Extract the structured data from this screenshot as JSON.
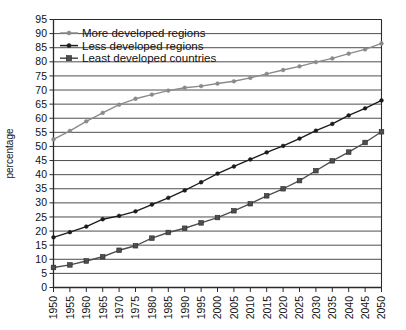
{
  "chart_data": {
    "type": "line",
    "title": "",
    "xlabel": "",
    "ylabel": "percentage",
    "ylim": [
      0,
      95
    ],
    "ytick_step": 5,
    "grid": true,
    "legend_position": "top-left",
    "x": [
      1950,
      1955,
      1960,
      1965,
      1970,
      1975,
      1980,
      1985,
      1990,
      1995,
      2000,
      2005,
      2010,
      2015,
      2020,
      2025,
      2030,
      2035,
      2040,
      2045,
      2050
    ],
    "xticks": [
      "1950",
      "1955",
      "1960",
      "1965",
      "1970",
      "1975",
      "1980",
      "1985",
      "1990",
      "1995",
      "2000",
      "2005",
      "2010",
      "2015",
      "2020",
      "2025",
      "2030",
      "2035",
      "2040",
      "2045",
      "2050"
    ],
    "yticks": [
      "0",
      "5",
      "10",
      "15",
      "20",
      "25",
      "30",
      "35",
      "40",
      "45",
      "50",
      "55",
      "60",
      "65",
      "70",
      "75",
      "80",
      "85",
      "90",
      "95"
    ],
    "series": [
      {
        "name": "More developed regions",
        "color": "#8a8a8a",
        "marker": "circle",
        "values": [
          52.5,
          55.5,
          58.9,
          61.9,
          64.8,
          66.9,
          68.4,
          69.8,
          70.8,
          71.4,
          72.3,
          73.1,
          74.3,
          75.7,
          77.1,
          78.4,
          79.9,
          81.2,
          82.9,
          84.4,
          86.5
        ]
      },
      {
        "name": "Less developed regions",
        "color": "#1c1c1c",
        "marker": "circle",
        "values": [
          17.8,
          19.6,
          21.6,
          24.2,
          25.4,
          27.0,
          29.4,
          31.8,
          34.4,
          37.3,
          40.4,
          42.9,
          45.4,
          47.9,
          50.2,
          52.8,
          55.6,
          58.0,
          61.0,
          63.5,
          66.3
        ]
      },
      {
        "name": "Least developed countries",
        "color": "#4d4d4d",
        "marker": "square",
        "values": [
          7.1,
          8.0,
          9.4,
          10.9,
          13.2,
          14.8,
          17.5,
          19.5,
          21.0,
          22.9,
          24.8,
          27.2,
          29.7,
          32.5,
          35.0,
          37.9,
          41.4,
          44.9,
          48.0,
          51.4,
          55.2
        ]
      }
    ]
  },
  "legend": {
    "items": [
      {
        "label": "More developed regions"
      },
      {
        "label": "Less developed regions"
      },
      {
        "label": "Least developed countries"
      }
    ]
  },
  "axes": {
    "y_title": "percentage"
  }
}
